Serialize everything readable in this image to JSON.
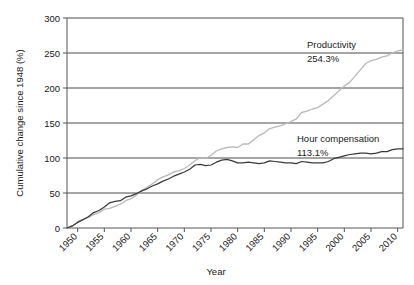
{
  "chart_data": {
    "type": "line",
    "title": "",
    "xlabel": "Year",
    "ylabel": "Cumulative change since 1948 (%)",
    "xlim": [
      1948,
      2011
    ],
    "ylim": [
      0,
      300
    ],
    "grid": true,
    "legend": "annotations-on-plot",
    "xticks": [
      1950,
      1955,
      1960,
      1965,
      1970,
      1975,
      1980,
      1985,
      1990,
      1995,
      2000,
      2005,
      2010
    ],
    "xtick_labels": [
      "1950",
      "1955",
      "1960",
      "1965",
      "1970",
      "1975",
      "1980",
      "1985",
      "1990",
      "1995",
      "2000",
      "2005",
      "2010"
    ],
    "yticks": [
      0,
      50,
      100,
      150,
      200,
      250,
      300
    ],
    "ytick_labels": [
      "0",
      "50",
      "100",
      "150",
      "200",
      "250",
      "300"
    ],
    "series": [
      {
        "name": "Productivity",
        "color": "#b9b9b9",
        "final_label": "254.3%",
        "final_value": 254.3,
        "x": [
          1948,
          1949,
          1950,
          1951,
          1952,
          1953,
          1954,
          1955,
          1956,
          1957,
          1958,
          1959,
          1960,
          1961,
          1962,
          1963,
          1964,
          1965,
          1966,
          1967,
          1968,
          1969,
          1970,
          1971,
          1972,
          1973,
          1974,
          1975,
          1976,
          1977,
          1978,
          1979,
          1980,
          1981,
          1982,
          1983,
          1984,
          1985,
          1986,
          1987,
          1988,
          1989,
          1990,
          1991,
          1992,
          1993,
          1994,
          1995,
          1996,
          1997,
          1998,
          1999,
          2000,
          2001,
          2002,
          2003,
          2004,
          2005,
          2006,
          2007,
          2008,
          2009,
          2010,
          2011
        ],
        "y": [
          0,
          3,
          9,
          12,
          15,
          19,
          22,
          27,
          28,
          31,
          34,
          39,
          42,
          47,
          53,
          58,
          63,
          69,
          73,
          76,
          80,
          82,
          85,
          90,
          96,
          101,
          99,
          104,
          110,
          113,
          115,
          116,
          115,
          120,
          120,
          126,
          132,
          136,
          142,
          144,
          146,
          149,
          152,
          156,
          165,
          167,
          170,
          172,
          177,
          182,
          189,
          196,
          203,
          208,
          217,
          226,
          235,
          239,
          241,
          244,
          246,
          250,
          253,
          254.3
        ]
      },
      {
        "name": "Hour compensation",
        "color": "#3a3a3a",
        "final_label": "113.1%",
        "final_value": 113.1,
        "x": [
          1948,
          1949,
          1950,
          1951,
          1952,
          1953,
          1954,
          1955,
          1956,
          1957,
          1958,
          1959,
          1960,
          1961,
          1962,
          1963,
          1964,
          1965,
          1966,
          1967,
          1968,
          1969,
          1970,
          1971,
          1972,
          1973,
          1974,
          1975,
          1976,
          1977,
          1978,
          1979,
          1980,
          1981,
          1982,
          1983,
          1984,
          1985,
          1986,
          1987,
          1988,
          1989,
          1990,
          1991,
          1992,
          1993,
          1994,
          1995,
          1996,
          1997,
          1998,
          1999,
          2000,
          2001,
          2002,
          2003,
          2004,
          2005,
          2006,
          2007,
          2008,
          2009,
          2010,
          2011
        ],
        "y": [
          0,
          3,
          8,
          12,
          16,
          22,
          25,
          30,
          36,
          38,
          39,
          44,
          46,
          49,
          53,
          56,
          60,
          63,
          67,
          70,
          74,
          77,
          80,
          84,
          90,
          91,
          89,
          90,
          94,
          97,
          98,
          96,
          93,
          93,
          94,
          93,
          92,
          93,
          96,
          95,
          94,
          93,
          93,
          92,
          95,
          94,
          93,
          93,
          93,
          95,
          99,
          101,
          103,
          105,
          106,
          107,
          107,
          106,
          107,
          109,
          109,
          112,
          113,
          113.1
        ]
      }
    ],
    "annotations": [
      {
        "name": "productivity-annotation",
        "label": "Productivity",
        "value": "254.3%",
        "x": 2001,
        "y": 268
      },
      {
        "name": "hour-compensation-annotation",
        "label": "Hour compensation",
        "value": "113.1%",
        "x": 1999,
        "y": 136
      }
    ]
  },
  "axes": {
    "y_title": "Cumulative change since 1948 (%)",
    "x_title": "Year"
  }
}
